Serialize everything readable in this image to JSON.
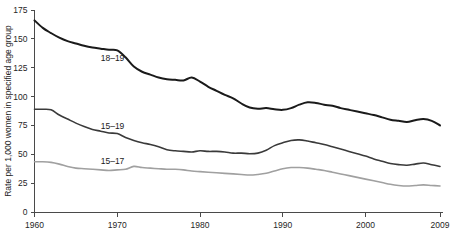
{
  "chart_data": {
    "type": "line",
    "title": "",
    "subtitle": "",
    "xlabel": "",
    "ylabel": "Rate per 1,000 women in specified age group",
    "xlim": [
      1960,
      2009
    ],
    "ylim": [
      0,
      175
    ],
    "grid": false,
    "legend_position": "inline-labels",
    "y_ticks": [
      0,
      25,
      50,
      75,
      100,
      125,
      150,
      175
    ],
    "y_tick_labels": [
      "0",
      "25",
      "50",
      "75",
      "100",
      "125",
      "150",
      "175"
    ],
    "x_ticks": [
      1960,
      1970,
      1980,
      1990,
      2000,
      2009
    ],
    "x_tick_labels": [
      "1960",
      "1970",
      "1980",
      "1990",
      "2000",
      "2009"
    ],
    "x": [
      1960,
      1961,
      1962,
      1963,
      1964,
      1965,
      1966,
      1967,
      1968,
      1969,
      1970,
      1971,
      1972,
      1973,
      1974,
      1975,
      1976,
      1977,
      1978,
      1979,
      1980,
      1981,
      1982,
      1983,
      1984,
      1985,
      1986,
      1987,
      1988,
      1989,
      1990,
      1991,
      1992,
      1993,
      1994,
      1995,
      1996,
      1997,
      1998,
      1999,
      2000,
      2001,
      2002,
      2003,
      2004,
      2005,
      2006,
      2007,
      2008,
      2009
    ],
    "series": [
      {
        "name": "18-19",
        "label": "18–19",
        "color": "#1a1a1a",
        "stroke_width": 2.0,
        "label_x": 1968,
        "label_y": 131,
        "values": [
          166.0,
          159.5,
          155.0,
          151.0,
          148.0,
          146.0,
          144.0,
          142.5,
          141.5,
          140.5,
          140.0,
          134.0,
          126.0,
          121.5,
          119.0,
          116.5,
          115.0,
          114.5,
          114.0,
          116.5,
          113.0,
          108.5,
          105.0,
          101.5,
          98.5,
          94.0,
          90.5,
          89.5,
          90.0,
          89.0,
          88.5,
          90.0,
          93.0,
          95.0,
          94.5,
          93.0,
          92.0,
          90.0,
          88.5,
          87.0,
          85.5,
          84.0,
          82.0,
          80.0,
          79.0,
          78.0,
          79.5,
          80.5,
          79.0,
          75.0
        ]
      },
      {
        "name": "15-19",
        "label": "15–19",
        "color": "#3a3a3a",
        "stroke_width": 1.6,
        "label_x": 1968,
        "label_y": 72,
        "values": [
          89.0,
          89.0,
          88.5,
          84.0,
          80.5,
          77.0,
          74.0,
          71.5,
          70.0,
          68.5,
          68.0,
          64.5,
          62.0,
          60.0,
          58.5,
          56.5,
          54.0,
          53.0,
          52.5,
          52.0,
          53.0,
          52.5,
          52.5,
          52.0,
          51.0,
          51.0,
          50.5,
          51.0,
          53.5,
          57.5,
          60.0,
          62.0,
          62.5,
          61.5,
          60.0,
          58.5,
          56.5,
          54.5,
          52.5,
          50.5,
          48.5,
          46.0,
          44.0,
          42.0,
          41.0,
          40.5,
          41.5,
          42.5,
          41.0,
          39.5
        ]
      },
      {
        "name": "15-17",
        "label": "15–17",
        "color": "#a0a0a0",
        "stroke_width": 1.6,
        "label_x": 1968,
        "label_y": 42,
        "values": [
          43.5,
          43.5,
          43.0,
          41.5,
          39.5,
          38.0,
          37.5,
          37.0,
          36.5,
          36.0,
          36.5,
          37.0,
          39.5,
          38.5,
          38.0,
          37.5,
          37.0,
          37.0,
          36.5,
          35.5,
          35.0,
          34.5,
          34.0,
          33.5,
          33.0,
          32.5,
          32.0,
          32.5,
          33.5,
          35.5,
          37.5,
          38.5,
          38.5,
          38.0,
          37.0,
          36.0,
          34.5,
          33.0,
          31.5,
          30.0,
          28.5,
          27.0,
          25.5,
          24.0,
          23.0,
          22.5,
          23.0,
          23.5,
          23.0,
          22.5
        ]
      }
    ]
  }
}
